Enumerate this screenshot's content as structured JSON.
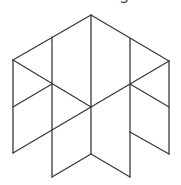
{
  "figure": {
    "stroke_color": "#3a3a3a",
    "background": "#ffffff",
    "cut_text": "g",
    "vertices": {
      "top": [
        91,
        15
      ],
      "upper_left": [
        13,
        60
      ],
      "upper_right": [
        169,
        61
      ],
      "center": [
        91,
        107
      ]
    },
    "lines": [
      {
        "x1": 13,
        "y1": 60,
        "x2": 91,
        "y2": 15
      },
      {
        "x1": 91,
        "y1": 15,
        "x2": 169,
        "y2": 61
      },
      {
        "x1": 13,
        "y1": 60,
        "x2": 13,
        "y2": 153
      },
      {
        "x1": 52,
        "y1": 37,
        "x2": 52,
        "y2": 177
      },
      {
        "x1": 91,
        "y1": 15,
        "x2": 91,
        "y2": 154
      },
      {
        "x1": 130,
        "y1": 38,
        "x2": 130,
        "y2": 177
      },
      {
        "x1": 169,
        "y1": 61,
        "x2": 169,
        "y2": 154
      },
      {
        "x1": 13,
        "y1": 60,
        "x2": 91,
        "y2": 107
      },
      {
        "x1": 169,
        "y1": 61,
        "x2": 91,
        "y2": 107
      },
      {
        "x1": 52,
        "y1": 84,
        "x2": 13,
        "y2": 107
      },
      {
        "x1": 130,
        "y1": 84,
        "x2": 169,
        "y2": 107
      },
      {
        "x1": 91,
        "y1": 107,
        "x2": 13,
        "y2": 153
      },
      {
        "x1": 130,
        "y1": 132,
        "x2": 169,
        "y2": 154
      },
      {
        "x1": 52,
        "y1": 177,
        "x2": 91,
        "y2": 154
      },
      {
        "x1": 91,
        "y1": 154,
        "x2": 130,
        "y2": 177
      }
    ]
  }
}
